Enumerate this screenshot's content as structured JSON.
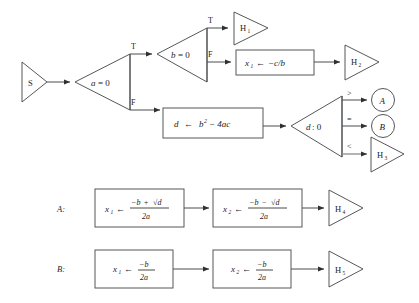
{
  "diagram": {
    "colors": {
      "background": "#ffffff",
      "shape_stroke": "#55575a",
      "connector": "#4a4c4f",
      "connector_gray": "#8a8c8f",
      "text": "#1b1c1d"
    },
    "start": {
      "label": "S",
      "shape": "triangle-right"
    },
    "decisions": [
      {
        "id": "a-zero",
        "label": "a = 0",
        "label_var": "a",
        "label_rest": "= 0",
        "shape": "triangle-left",
        "branches": [
          "T",
          "F"
        ]
      },
      {
        "id": "b-zero",
        "label": "b = 0",
        "label_var": "b",
        "label_rest": "= 0",
        "shape": "triangle-left",
        "branches": [
          "T",
          "F"
        ]
      },
      {
        "id": "d-compare-zero",
        "label": "d : 0",
        "label_var": "d",
        "label_rest": ": 0",
        "shape": "triangle-left",
        "branches": [
          ">",
          "=",
          "<"
        ]
      }
    ],
    "branch_labels": {
      "true": "T",
      "false": "F",
      "greater": ">",
      "equal": "=",
      "less": "<"
    },
    "processes": [
      {
        "id": "x1-neg-c-over-b",
        "lhs": "x",
        "lhs_sub": "1",
        "arrow": "←",
        "rhs": "−c/b"
      },
      {
        "id": "d-assign-discriminant",
        "lhs": "d",
        "arrow": "←",
        "rhs_base": "b",
        "rhs_sup": "2",
        "rhs_tail": "− 4ac"
      }
    ],
    "terminals": [
      {
        "id": "h1",
        "label": "H",
        "sub": "1",
        "shape": "triangle-right"
      },
      {
        "id": "h2",
        "label": "H",
        "sub": "2",
        "shape": "triangle-right"
      },
      {
        "id": "h3",
        "label": "H",
        "sub": "3",
        "shape": "triangle-right"
      },
      {
        "id": "h4",
        "label": "H",
        "sub": "4",
        "shape": "triangle-right"
      },
      {
        "id": "h5",
        "label": "H",
        "sub": "5",
        "shape": "triangle-right"
      }
    ],
    "connectors": [
      {
        "id": "connector-a",
        "label": "A",
        "shape": "circle"
      },
      {
        "id": "connector-b",
        "label": "B",
        "shape": "circle"
      }
    ],
    "subroutine_rows": [
      {
        "id": "row-a",
        "row_label": "A:",
        "steps": [
          {
            "id": "a-step1",
            "lhs": "x",
            "lhs_sub": "1",
            "arrow": "←",
            "num_a": "−b",
            "num_op": "+",
            "num_radical": "√d",
            "den": "2a"
          },
          {
            "id": "a-step2",
            "lhs": "x",
            "lhs_sub": "2",
            "arrow": "←",
            "num_a": "−b",
            "num_op": "−",
            "num_radical": "√d",
            "den": "2a"
          }
        ],
        "terminal": {
          "label": "H",
          "sub": "4"
        }
      },
      {
        "id": "row-b",
        "row_label": "B:",
        "steps": [
          {
            "id": "b-step1",
            "lhs": "x",
            "lhs_sub": "1",
            "arrow": "←",
            "num_a": "−b",
            "num_op": "",
            "num_radical": "",
            "den": "2a"
          },
          {
            "id": "b-step2",
            "lhs": "x",
            "lhs_sub": "2",
            "arrow": "←",
            "num_a": "−b",
            "num_op": "",
            "num_radical": "",
            "den": "2a"
          }
        ],
        "terminal": {
          "label": "H",
          "sub": "5"
        }
      }
    ]
  }
}
